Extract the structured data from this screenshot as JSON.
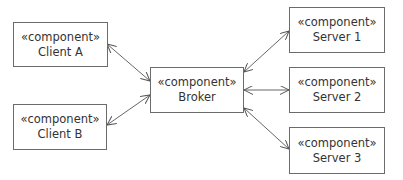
{
  "diagram": {
    "type": "component-diagram",
    "components": [
      {
        "id": "client-a",
        "stereotype": "«component»",
        "name": "Client A"
      },
      {
        "id": "client-b",
        "stereotype": "«component»",
        "name": "Client B"
      },
      {
        "id": "broker",
        "stereotype": "«component»",
        "name": "Broker"
      },
      {
        "id": "server-1",
        "stereotype": "«component»",
        "name": "Server 1"
      },
      {
        "id": "server-2",
        "stereotype": "«component»",
        "name": "Server 2"
      },
      {
        "id": "server-3",
        "stereotype": "«component»",
        "name": "Server 3"
      }
    ],
    "connections": [
      {
        "from": "client-a",
        "to": "broker",
        "direction": "bidirectional"
      },
      {
        "from": "client-b",
        "to": "broker",
        "direction": "bidirectional"
      },
      {
        "from": "broker",
        "to": "server-1",
        "direction": "bidirectional"
      },
      {
        "from": "broker",
        "to": "server-2",
        "direction": "bidirectional"
      },
      {
        "from": "broker",
        "to": "server-3",
        "direction": "bidirectional"
      }
    ]
  }
}
